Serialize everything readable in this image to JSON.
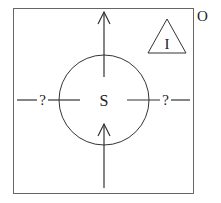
{
  "diagram": {
    "outer_label": "O",
    "inner_triangle_label": "I",
    "center_label": "S",
    "left_link_label": "?",
    "right_link_label": "?",
    "arrows": [
      {
        "name": "outgoing-up-arrow",
        "direction": "up",
        "from": "S",
        "to": "O"
      },
      {
        "name": "incoming-up-arrow",
        "direction": "up",
        "from": "O",
        "to": "S"
      }
    ],
    "links": [
      {
        "name": "left-link",
        "side": "left",
        "label": "?"
      },
      {
        "name": "right-link",
        "side": "right",
        "label": "?"
      }
    ],
    "colors": {
      "stroke": "#333333",
      "frame": "#555555",
      "background": "#ffffff"
    }
  }
}
